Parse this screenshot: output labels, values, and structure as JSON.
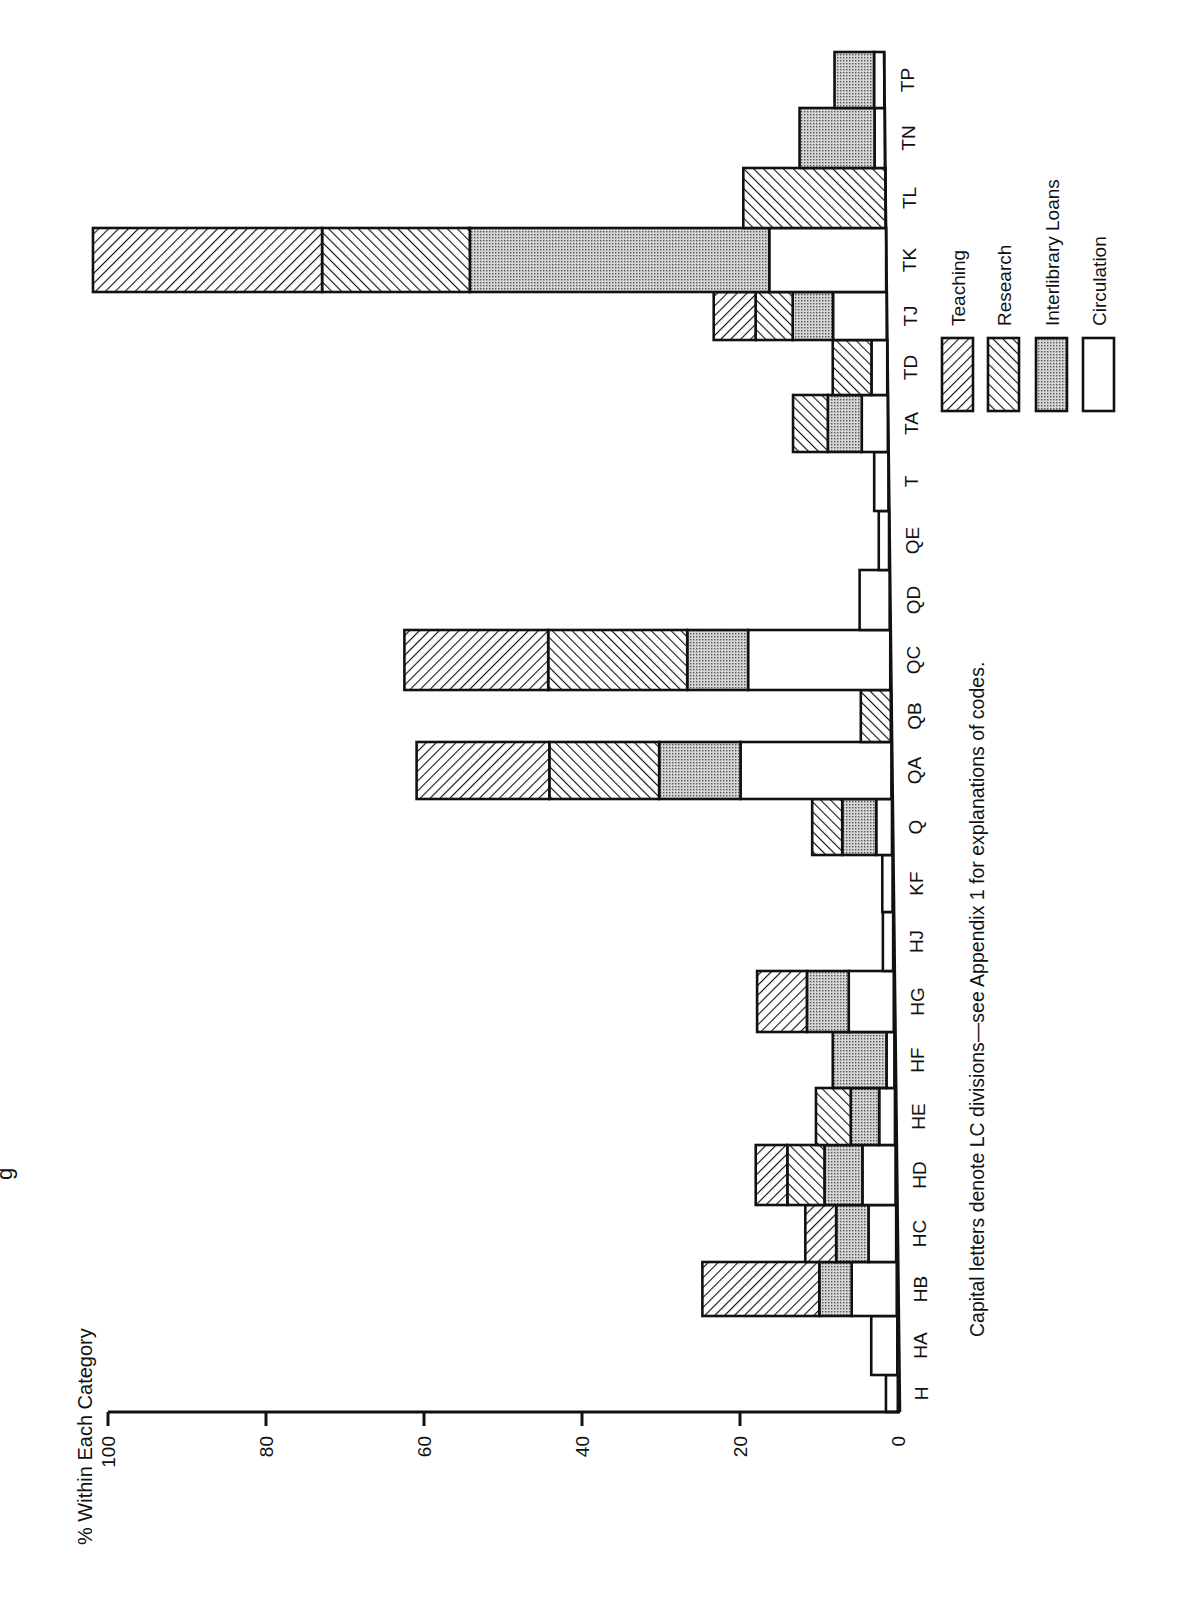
{
  "chart_data": {
    "type": "bar",
    "orientation": "stacked bar chart, printed page rotated 90° counter-clockwise",
    "title_fragment": "g",
    "ylabel": "% Within Each Category",
    "xlabel": "",
    "ylim": [
      0,
      100
    ],
    "yticks": [
      0,
      20,
      40,
      60,
      80,
      100
    ],
    "caption": "Capital letters denote LC divisions—see Appendix 1 for explanations of codes.",
    "legend_position": "right of chart (rotated), stacked entries",
    "stack_order_from_baseline": [
      "Circulation",
      "Interlibrary Loans",
      "Research",
      "Teaching"
    ],
    "categories": [
      "H",
      "HA",
      "HB",
      "HC",
      "HD",
      "HE",
      "HF",
      "HG",
      "HJ",
      "KF",
      "Q",
      "QA",
      "QB",
      "QC",
      "QD",
      "QE",
      "T",
      "TA",
      "TD",
      "TJ",
      "TK",
      "TL",
      "TN",
      "TP"
    ],
    "series": [
      {
        "name": "Circulation",
        "pattern": "plain",
        "values": [
          1.5,
          3.3,
          5.7,
          3.5,
          4.2,
          2.0,
          1.0,
          5.7,
          1.3,
          1.3,
          2.0,
          19.1,
          0,
          18.0,
          3.8,
          1.3,
          1.8,
          3.3,
          2.0,
          6.8,
          14.8,
          0,
          1.3,
          1.3
        ]
      },
      {
        "name": "Interlibrary Loans",
        "pattern": "dotted",
        "values": [
          0,
          0,
          4.1,
          4.1,
          4.8,
          3.6,
          6.8,
          5.3,
          0,
          0,
          4.3,
          10.3,
          0,
          7.7,
          0,
          0,
          0,
          4.3,
          0,
          5.1,
          37.9,
          0,
          9.5,
          5.0
        ]
      },
      {
        "name": "Research",
        "pattern": "hatch-right",
        "values": [
          0,
          0,
          0,
          0,
          4.7,
          4.4,
          0,
          0,
          0,
          0,
          3.8,
          13.9,
          3.8,
          17.6,
          0,
          0,
          0,
          4.4,
          4.9,
          4.7,
          18.7,
          18.0,
          0,
          0
        ]
      },
      {
        "name": "Teaching",
        "pattern": "hatch-left",
        "values": [
          0,
          0,
          14.8,
          3.9,
          4.0,
          0,
          0,
          6.3,
          0,
          0,
          0,
          16.8,
          0,
          18.2,
          0,
          0,
          0,
          0,
          0,
          5.3,
          29.0,
          0,
          0,
          0
        ]
      }
    ],
    "totals": [
      1.5,
      3.3,
      24.6,
      11.5,
      17.7,
      10.0,
      7.8,
      17.3,
      1.3,
      1.3,
      10.1,
      60.1,
      3.8,
      61.5,
      3.8,
      1.3,
      1.8,
      12.0,
      6.9,
      21.9,
      100.4,
      18.0,
      10.8,
      6.3
    ],
    "grid": false
  },
  "legend": {
    "items": [
      {
        "label": "Teaching",
        "pattern": "hatch-left"
      },
      {
        "label": "Research",
        "pattern": "hatch-right"
      },
      {
        "label": "Interlibrary Loans",
        "pattern": "dotted"
      },
      {
        "label": "Circulation",
        "pattern": "plain"
      }
    ]
  },
  "axis": {
    "label": "% Within Each Category",
    "ticks": [
      "0",
      "20",
      "40",
      "60",
      "80",
      "100"
    ]
  },
  "caption": "Capital letters denote LC divisions—see Appendix 1 for explanations of codes.",
  "colors": {
    "ink": "#111111",
    "ill_fill": "#bdbdbd",
    "paper": "#ffffff"
  }
}
